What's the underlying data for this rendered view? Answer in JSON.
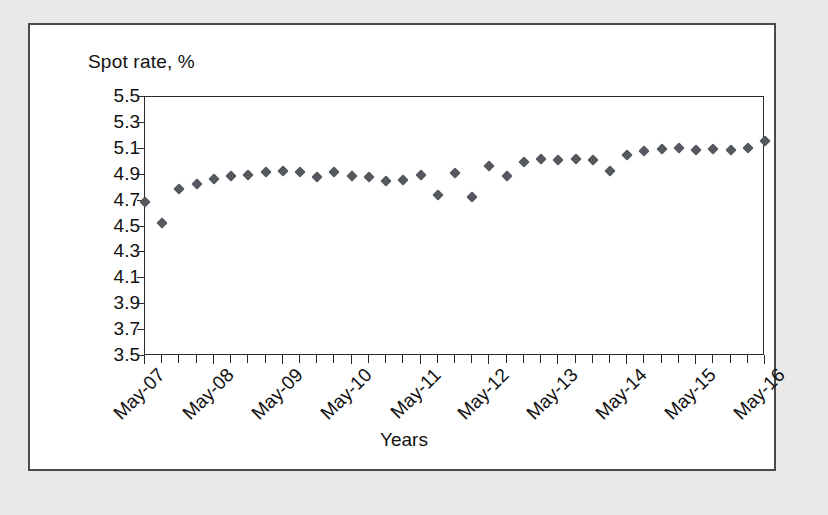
{
  "figure": {
    "y_axis_title": "Spot rate, %",
    "x_axis_title": "Years"
  },
  "colors": {
    "page_background": "#e8e8e6",
    "figure_background": "#ffffff",
    "figure_border": "#4a4a4a",
    "axis": "#2b2b2b",
    "marker": "#55595f",
    "text": "#111111"
  },
  "chart_data": {
    "type": "scatter",
    "title": "",
    "xlabel": "Years",
    "ylabel": "Spot rate, %",
    "ylim": [
      3.5,
      5.5
    ],
    "y_ticks": [
      5.5,
      5.3,
      5.1,
      4.9,
      4.7,
      4.5,
      4.3,
      4.1,
      3.9,
      3.7,
      3.5
    ],
    "y_tick_labels": [
      "5.5",
      "5.3",
      "5.1",
      "4.9",
      "4.7",
      "4.5",
      "4.3",
      "4.1",
      "3.9",
      "3.7",
      "3.5"
    ],
    "x_tick_labels": [
      "May-07",
      "May-08",
      "May-09",
      "May-10",
      "May-11",
      "May-12",
      "May-13",
      "May-14",
      "May-15",
      "May-16"
    ],
    "x_major_tick_interval": 4,
    "x_minor_tick_count": 39,
    "grid": false,
    "legend": false,
    "marker_shape": "diamond",
    "x": [
      "May-07",
      "Aug-07",
      "Nov-07",
      "Feb-08",
      "May-08",
      "Aug-08",
      "Nov-08",
      "Feb-09",
      "May-09",
      "Aug-09",
      "Nov-09",
      "Feb-10",
      "May-10",
      "Aug-10",
      "Nov-10",
      "Feb-11",
      "May-11",
      "Aug-11",
      "Nov-11",
      "Feb-12",
      "May-12",
      "Aug-12",
      "Nov-12",
      "Feb-13",
      "May-13",
      "Aug-13",
      "Nov-13",
      "Feb-14",
      "May-14",
      "Aug-14",
      "Nov-14",
      "Feb-15",
      "May-15",
      "Aug-15",
      "Nov-15",
      "Feb-16",
      "May-16"
    ],
    "values": [
      4.69,
      4.53,
      4.79,
      4.83,
      4.87,
      4.89,
      4.9,
      4.92,
      4.93,
      4.92,
      4.88,
      4.92,
      4.89,
      4.88,
      4.85,
      4.86,
      4.9,
      4.74,
      4.91,
      4.73,
      4.97,
      4.89,
      5.0,
      5.02,
      5.01,
      5.02,
      5.01,
      4.93,
      5.05,
      5.08,
      5.1,
      5.11,
      5.09,
      5.1,
      5.09,
      5.11,
      5.16
    ]
  }
}
